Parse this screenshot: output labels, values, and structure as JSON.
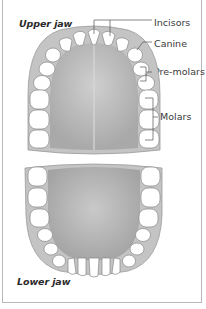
{
  "diagram": {
    "upper_label": "Upper jaw",
    "lower_label": "Lower jaw",
    "tooth_labels": {
      "incisors": "Incisors",
      "canine": "Canine",
      "premolars": "Pre-molars",
      "molars": "Molars"
    }
  },
  "colors": {
    "gum": "#c9c9c9",
    "palate": "#b5b5b5",
    "tooth": "#ffffff",
    "outline": "#8a8a8a",
    "border": "#b8b8b8"
  }
}
